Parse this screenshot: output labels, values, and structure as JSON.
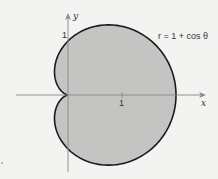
{
  "chart_data": {
    "type": "area",
    "title": "",
    "equation": "r = 1 + cos θ",
    "xlabel": "x",
    "ylabel": "y",
    "x_ticks": [
      {
        "value": 1,
        "label": "1"
      }
    ],
    "y_ticks": [
      {
        "value": 1,
        "label": "1"
      }
    ],
    "xlim": [
      -0.95,
      2.55
    ],
    "ylim": [
      -1.42,
      1.5
    ],
    "grid": false,
    "key_points": [
      {
        "x": 0,
        "y": 0,
        "note": "cusp"
      },
      {
        "x": 2,
        "y": 0
      },
      {
        "x": 0,
        "y": 1
      },
      {
        "x": 0,
        "y": -1
      }
    ],
    "fill_color": "#c4c4c2",
    "stroke_color": "#1a1a1a"
  },
  "labels": {
    "x_axis": "x",
    "y_axis": "y",
    "x_tick": "1",
    "y_tick": "1",
    "equation": "r = 1 + cos θ"
  }
}
